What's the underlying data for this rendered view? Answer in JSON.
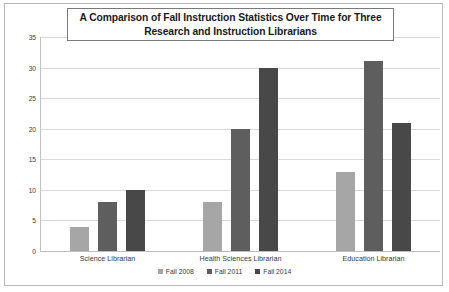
{
  "chart_data": {
    "type": "bar",
    "title": "A Comparison of Fall Instruction Statistics Over Time for Three Research and Instruction Librarians",
    "title_lines": [
      "A Comparison of Fall Instruction Statistics Over Time for Three",
      "Research and Instruction Librarians"
    ],
    "xlabel": "",
    "ylabel": "",
    "ylim": [
      0,
      35
    ],
    "ytick_step": 5,
    "ytick_labels": [
      "0",
      "5",
      "10",
      "15",
      "20",
      "25",
      "30",
      "35"
    ],
    "grid": true,
    "legend_position": "bottom-center",
    "categories": [
      "Science Librarian",
      "Health Sciences Librarian",
      "Education Librarian"
    ],
    "series": [
      {
        "name": "Fall 2008",
        "color": "#a6a6a6",
        "values": [
          4,
          8,
          13
        ]
      },
      {
        "name": "Fall 2011",
        "color": "#5e5e5e",
        "values": [
          8,
          20,
          31
        ]
      },
      {
        "name": "Fall 2014",
        "color": "#484848",
        "values": [
          10,
          30,
          21
        ]
      }
    ],
    "grouped_values": [
      {
        "category": "Science Librarian",
        "Fall 2008": 4,
        "Fall 2011": 8,
        "Fall 2014": 10
      },
      {
        "category": "Health Sciences Librarian",
        "Fall 2008": 20,
        "Fall 2011": 20,
        "Fall 2014": 30
      },
      {
        "category": "Education Librarian",
        "Fall 2008": 13,
        "Fall 2011": 31,
        "Fall 2014": 21
      }
    ]
  },
  "colors": {
    "plot_background": "#ffffff",
    "frame_border": "#b9b9b9",
    "title_border": "#7a7a7a",
    "gridline": "#d9d9d9",
    "axis_line": "#c2c2c2",
    "text": "#3a3a3a"
  }
}
